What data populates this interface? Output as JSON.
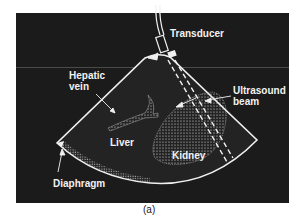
{
  "figure": {
    "caption": "(a)",
    "labels": {
      "transducer": "Transducer",
      "hepatic_vein_line1": "Hepatic",
      "hepatic_vein_line2": "vein",
      "ultrasound_beam_line1": "Ultrasound",
      "ultrasound_beam_line2": "beam",
      "liver": "Liver",
      "kidney": "Kidney",
      "diaphragm": "Diaphragm"
    },
    "colors": {
      "background": "#1b1b1b",
      "foreground": "#f2f2f2",
      "page": "#ffffff"
    }
  }
}
